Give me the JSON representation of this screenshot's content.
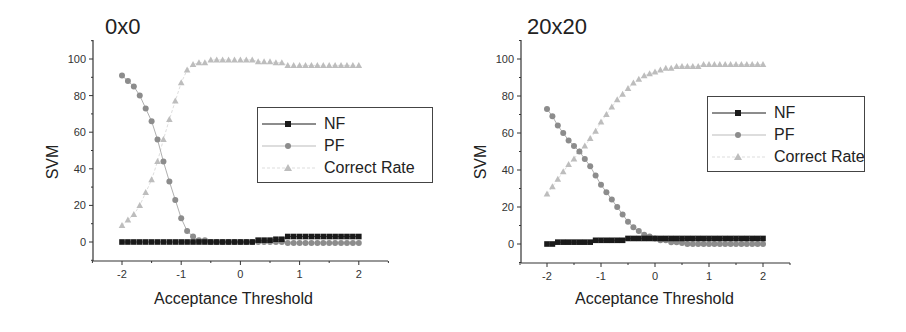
{
  "colors": {
    "nf": "#1a1a1a",
    "pf": "#8c8c8c",
    "cr": "#bdbdbd",
    "axis": "#333333"
  },
  "chart_data": [
    {
      "type": "line",
      "title": "0x0",
      "xlabel": "Acceptance Threshold",
      "ylabel": "SVM",
      "xlim": [
        -2.5,
        2.5
      ],
      "ylim": [
        -10,
        110
      ],
      "xticks": [
        -2,
        -1,
        0,
        1,
        2
      ],
      "yticks": [
        0,
        20,
        40,
        60,
        80,
        100
      ],
      "grid": false,
      "legend_position": "center-right",
      "x": [
        -2.0,
        -1.9,
        -1.8,
        -1.7,
        -1.6,
        -1.5,
        -1.4,
        -1.3,
        -1.2,
        -1.1,
        -1.0,
        -0.9,
        -0.8,
        -0.7,
        -0.6,
        -0.5,
        -0.4,
        -0.3,
        -0.2,
        -0.1,
        0.0,
        0.1,
        0.2,
        0.3,
        0.4,
        0.5,
        0.6,
        0.7,
        0.8,
        0.9,
        1.0,
        1.1,
        1.2,
        1.3,
        1.4,
        1.5,
        1.6,
        1.7,
        1.8,
        1.9,
        2.0
      ],
      "series": [
        {
          "name": "NF",
          "marker": "square",
          "values": [
            0,
            0,
            0,
            0,
            0,
            0,
            0,
            0,
            0,
            0,
            0,
            0,
            0,
            0,
            0,
            0,
            0,
            0,
            0,
            0,
            0,
            0,
            0,
            1,
            1,
            1,
            1.5,
            1.5,
            3,
            3,
            3,
            3,
            3,
            3,
            3,
            3,
            3,
            3,
            3,
            3,
            3
          ]
        },
        {
          "name": "PF",
          "marker": "circle",
          "values": [
            91,
            88,
            85,
            80,
            73,
            66,
            56,
            44,
            33,
            23,
            13,
            6,
            3,
            1,
            1,
            0,
            0,
            0,
            0,
            0,
            0,
            0,
            0,
            0,
            0,
            0,
            0,
            0,
            -0.5,
            -0.5,
            -0.5,
            -0.5,
            -0.5,
            -0.5,
            -0.5,
            -0.5,
            -0.5,
            -0.5,
            -0.5,
            -0.5,
            -0.5
          ]
        },
        {
          "name": "Correct Rate",
          "marker": "triangle",
          "values": [
            9,
            12,
            15,
            20,
            27,
            34,
            44,
            56,
            67,
            77,
            87,
            94,
            97,
            98,
            98,
            99.5,
            99.5,
            99.5,
            99.5,
            99.5,
            99.5,
            99.5,
            99.5,
            98.5,
            98.5,
            98.5,
            98,
            98,
            96.5,
            96.5,
            96.5,
            96.5,
            96.5,
            96.5,
            96.5,
            96.5,
            96.5,
            96.5,
            96.5,
            96.5,
            96.5
          ]
        }
      ]
    },
    {
      "type": "line",
      "title": "20x20",
      "xlabel": "Acceptance Threshold",
      "ylabel": "SVM",
      "xlim": [
        -2.5,
        2.5
      ],
      "ylim": [
        -10,
        110
      ],
      "xticks": [
        -2,
        -1,
        0,
        1,
        2
      ],
      "yticks": [
        0,
        20,
        40,
        60,
        80,
        100
      ],
      "grid": false,
      "legend_position": "center-right",
      "x": [
        -2.0,
        -1.9,
        -1.8,
        -1.7,
        -1.6,
        -1.5,
        -1.4,
        -1.3,
        -1.2,
        -1.1,
        -1.0,
        -0.9,
        -0.8,
        -0.7,
        -0.6,
        -0.5,
        -0.4,
        -0.3,
        -0.2,
        -0.1,
        0.0,
        0.1,
        0.2,
        0.3,
        0.4,
        0.5,
        0.6,
        0.7,
        0.8,
        0.9,
        1.0,
        1.1,
        1.2,
        1.3,
        1.4,
        1.5,
        1.6,
        1.7,
        1.8,
        1.9,
        2.0
      ],
      "series": [
        {
          "name": "NF",
          "marker": "square",
          "values": [
            0,
            0,
            1,
            1,
            1,
            1,
            1,
            1,
            1,
            2,
            2,
            2,
            2,
            2,
            2,
            3,
            3,
            3,
            3,
            3,
            3,
            3,
            3,
            3,
            3,
            3,
            3,
            3,
            3,
            3,
            3,
            3,
            3,
            3,
            3,
            3,
            3,
            3,
            3,
            3,
            3
          ]
        },
        {
          "name": "PF",
          "marker": "circle",
          "values": [
            73,
            69,
            64,
            60,
            56,
            53,
            50,
            46,
            42,
            37,
            32,
            28,
            24,
            20,
            16,
            12,
            9,
            7,
            5,
            4,
            3,
            2,
            2,
            1,
            1,
            0.5,
            0,
            0,
            0,
            0,
            0,
            0,
            0,
            0,
            0,
            0,
            0,
            0,
            0,
            0,
            0
          ]
        },
        {
          "name": "Correct Rate",
          "marker": "triangle",
          "values": [
            27,
            31,
            35,
            39,
            43,
            46,
            50,
            53,
            57,
            61,
            66,
            70,
            74,
            78,
            81,
            84,
            87,
            89,
            91,
            92,
            93,
            94,
            95,
            95,
            96,
            96,
            96,
            96,
            96,
            97,
            97,
            97,
            97,
            97,
            97,
            97,
            97,
            97,
            97,
            97,
            97
          ]
        }
      ]
    }
  ],
  "panels": [
    {
      "title": "0x0",
      "ylabel": "SVM",
      "xlabel": "Acceptance Threshold",
      "legend": [
        "NF",
        "PF",
        "Correct Rate"
      ]
    },
    {
      "title": "20x20",
      "ylabel": "SVM",
      "xlabel": "Acceptance Threshold",
      "legend": [
        "NF",
        "PF",
        "Correct Rate"
      ]
    }
  ]
}
